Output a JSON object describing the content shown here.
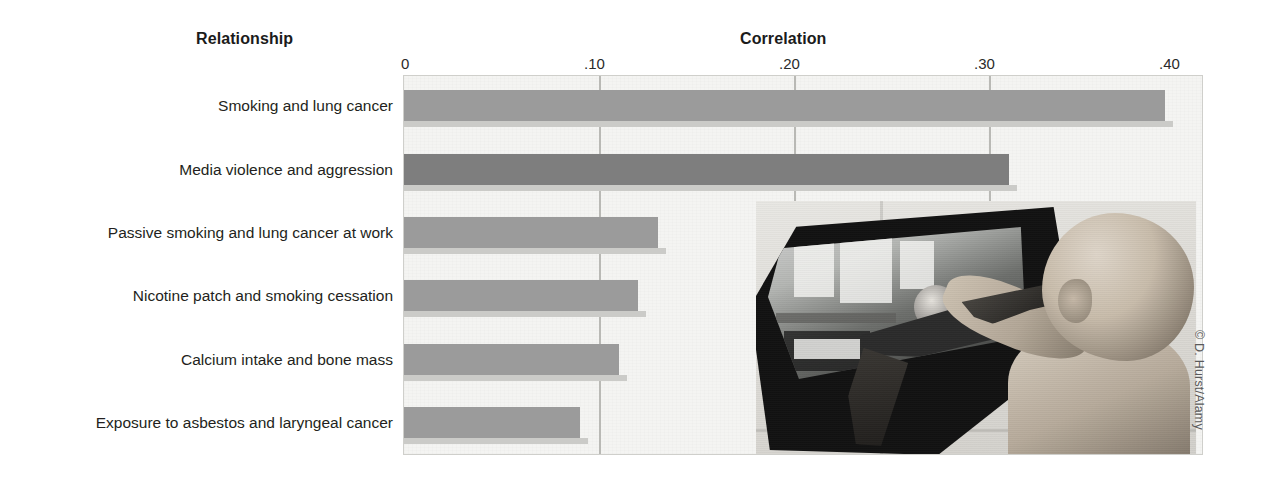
{
  "figure": {
    "relationship_heading": "Relationship",
    "correlation_heading": "Correlation",
    "credit": "© D. Hurst/Alamy",
    "photo_alt": "child-pointing-toy-gun-at-television-showing-violent-video-game",
    "colors": {
      "bar": "#9b9b9b",
      "bar_highlight": "#7e7e7e",
      "plot_background": "#f4f4f2",
      "gridline": "#b9b9b5",
      "text": "#231f20"
    }
  },
  "chart_data": {
    "type": "bar",
    "orientation": "horizontal",
    "title": "Correlation",
    "xlabel": "Correlation",
    "ylabel": "Relationship",
    "xlim": [
      0,
      0.4
    ],
    "grid": true,
    "legend": "none",
    "tick_labels": [
      "0",
      ".10",
      ".20",
      ".30",
      ".40"
    ],
    "tick_values": [
      0,
      0.1,
      0.2,
      0.3,
      0.4
    ],
    "categories": [
      "Smoking and lung cancer",
      "Media violence and aggression",
      "Passive smoking and lung cancer at work",
      "Nicotine patch and smoking cessation",
      "Calcium intake and bone mass",
      "Exposure to asbestos and laryngeal cancer"
    ],
    "values": [
      0.39,
      0.31,
      0.13,
      0.12,
      0.11,
      0.09
    ],
    "highlight_index": 1
  }
}
